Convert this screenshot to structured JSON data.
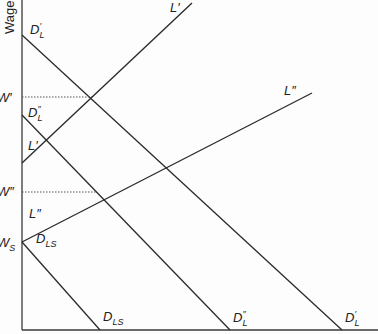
{
  "diagram": {
    "y_axis_label": "Wage",
    "wage_levels": {
      "w_prime": "W′",
      "w_double_prime": "W″",
      "w_s": "W",
      "w_s_sub": "S"
    },
    "curves": {
      "d_l_prime": {
        "base": "D",
        "sub": "L",
        "mark": "′"
      },
      "d_l_double_prime": {
        "base": "D",
        "sub": "L",
        "mark": "″"
      },
      "d_ls": {
        "base": "D",
        "sub": "LS"
      },
      "l_prime": "L′",
      "l_double_prime": "L″"
    },
    "colors": {
      "line": "#2a2a2a",
      "axis": "#3a3a3a",
      "dotted": "#555555"
    }
  }
}
